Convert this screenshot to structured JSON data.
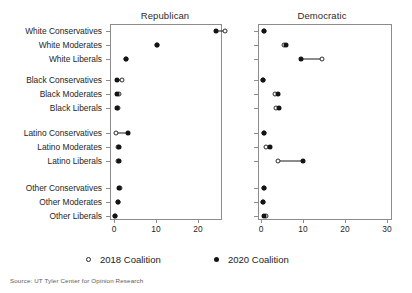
{
  "figure": {
    "source_note": "Source: UT Tyler Center for Opinion Research"
  },
  "legend": {
    "position": "bottom",
    "entries": [
      {
        "label": "2018 Coalition",
        "marker": "open-circle"
      },
      {
        "label": "2020 Coalition",
        "marker": "filled-circle"
      }
    ]
  },
  "chart_data": {
    "type": "scatter",
    "subtype": "dumbbell",
    "title": "",
    "xlabel": "",
    "ylabel": "",
    "xlim": [
      0,
      30
    ],
    "xticks": [
      0,
      10,
      20,
      30
    ],
    "xticklabels": [
      "0",
      "10",
      "20",
      "30"
    ],
    "grid": false,
    "panels": [
      "Republican",
      "Democratic"
    ],
    "categories": [
      "White Conservatives",
      "White Moderates",
      "White Liberals",
      "Black Conservatives",
      "Black Moderates",
      "Black Liberals",
      "Latino Conservatives",
      "Latino Moderates",
      "Latino Liberals",
      "Other Conservatives",
      "Other Moderates",
      "Other Liberals"
    ],
    "series": [
      {
        "name": "2018 Coalition",
        "marker": "open-circle",
        "panels": {
          "Republican": [
            26.4,
            10.2,
            2.8,
            1.9,
            1.2,
            0.9,
            0.4,
            0.9,
            1.0,
            1.5,
            0.9,
            0.2
          ],
          "Democratic": [
            0.6,
            5.5,
            14.5,
            0.5,
            3.4,
            3.6,
            0.6,
            1.3,
            4.0,
            0.6,
            0.5,
            1.3
          ]
        }
      },
      {
        "name": "2020 Coalition",
        "marker": "filled-circle",
        "panels": {
          "Republican": [
            24.3,
            10.2,
            2.8,
            0.8,
            0.8,
            0.6,
            3.3,
            1.1,
            1.1,
            1.3,
            0.9,
            0.2
          ],
          "Democratic": [
            0.6,
            6.0,
            9.5,
            0.5,
            4.0,
            4.2,
            0.6,
            2.2,
            10.0,
            0.6,
            0.5,
            0.6
          ]
        }
      }
    ]
  }
}
